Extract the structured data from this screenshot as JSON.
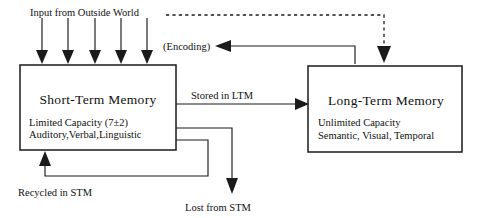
{
  "diagram": {
    "type": "flow-diagram",
    "boxes": [
      {
        "id": "stm",
        "title": "Short-Term  Memory",
        "subtitle_lines": [
          "Limited Capacity (7±2)",
          "Auditory,Verbal,Linguistic"
        ]
      },
      {
        "id": "ltm",
        "title": "Long-Term  Memory",
        "subtitle_lines": [
          "Unlimited Capacity",
          "Semantic, Visual, Temporal"
        ]
      }
    ],
    "labels": {
      "input": "Input from Outside World",
      "encoding": "(Encoding)",
      "stored_in_ltm": "Stored in LTM",
      "recycled_in_stm": "Recycled in STM",
      "lost_from_stm": "Lost from STM"
    },
    "colors": {
      "ink": "#1a1a1a",
      "background": "#ffffff"
    },
    "input_arrow_count": 5
  }
}
